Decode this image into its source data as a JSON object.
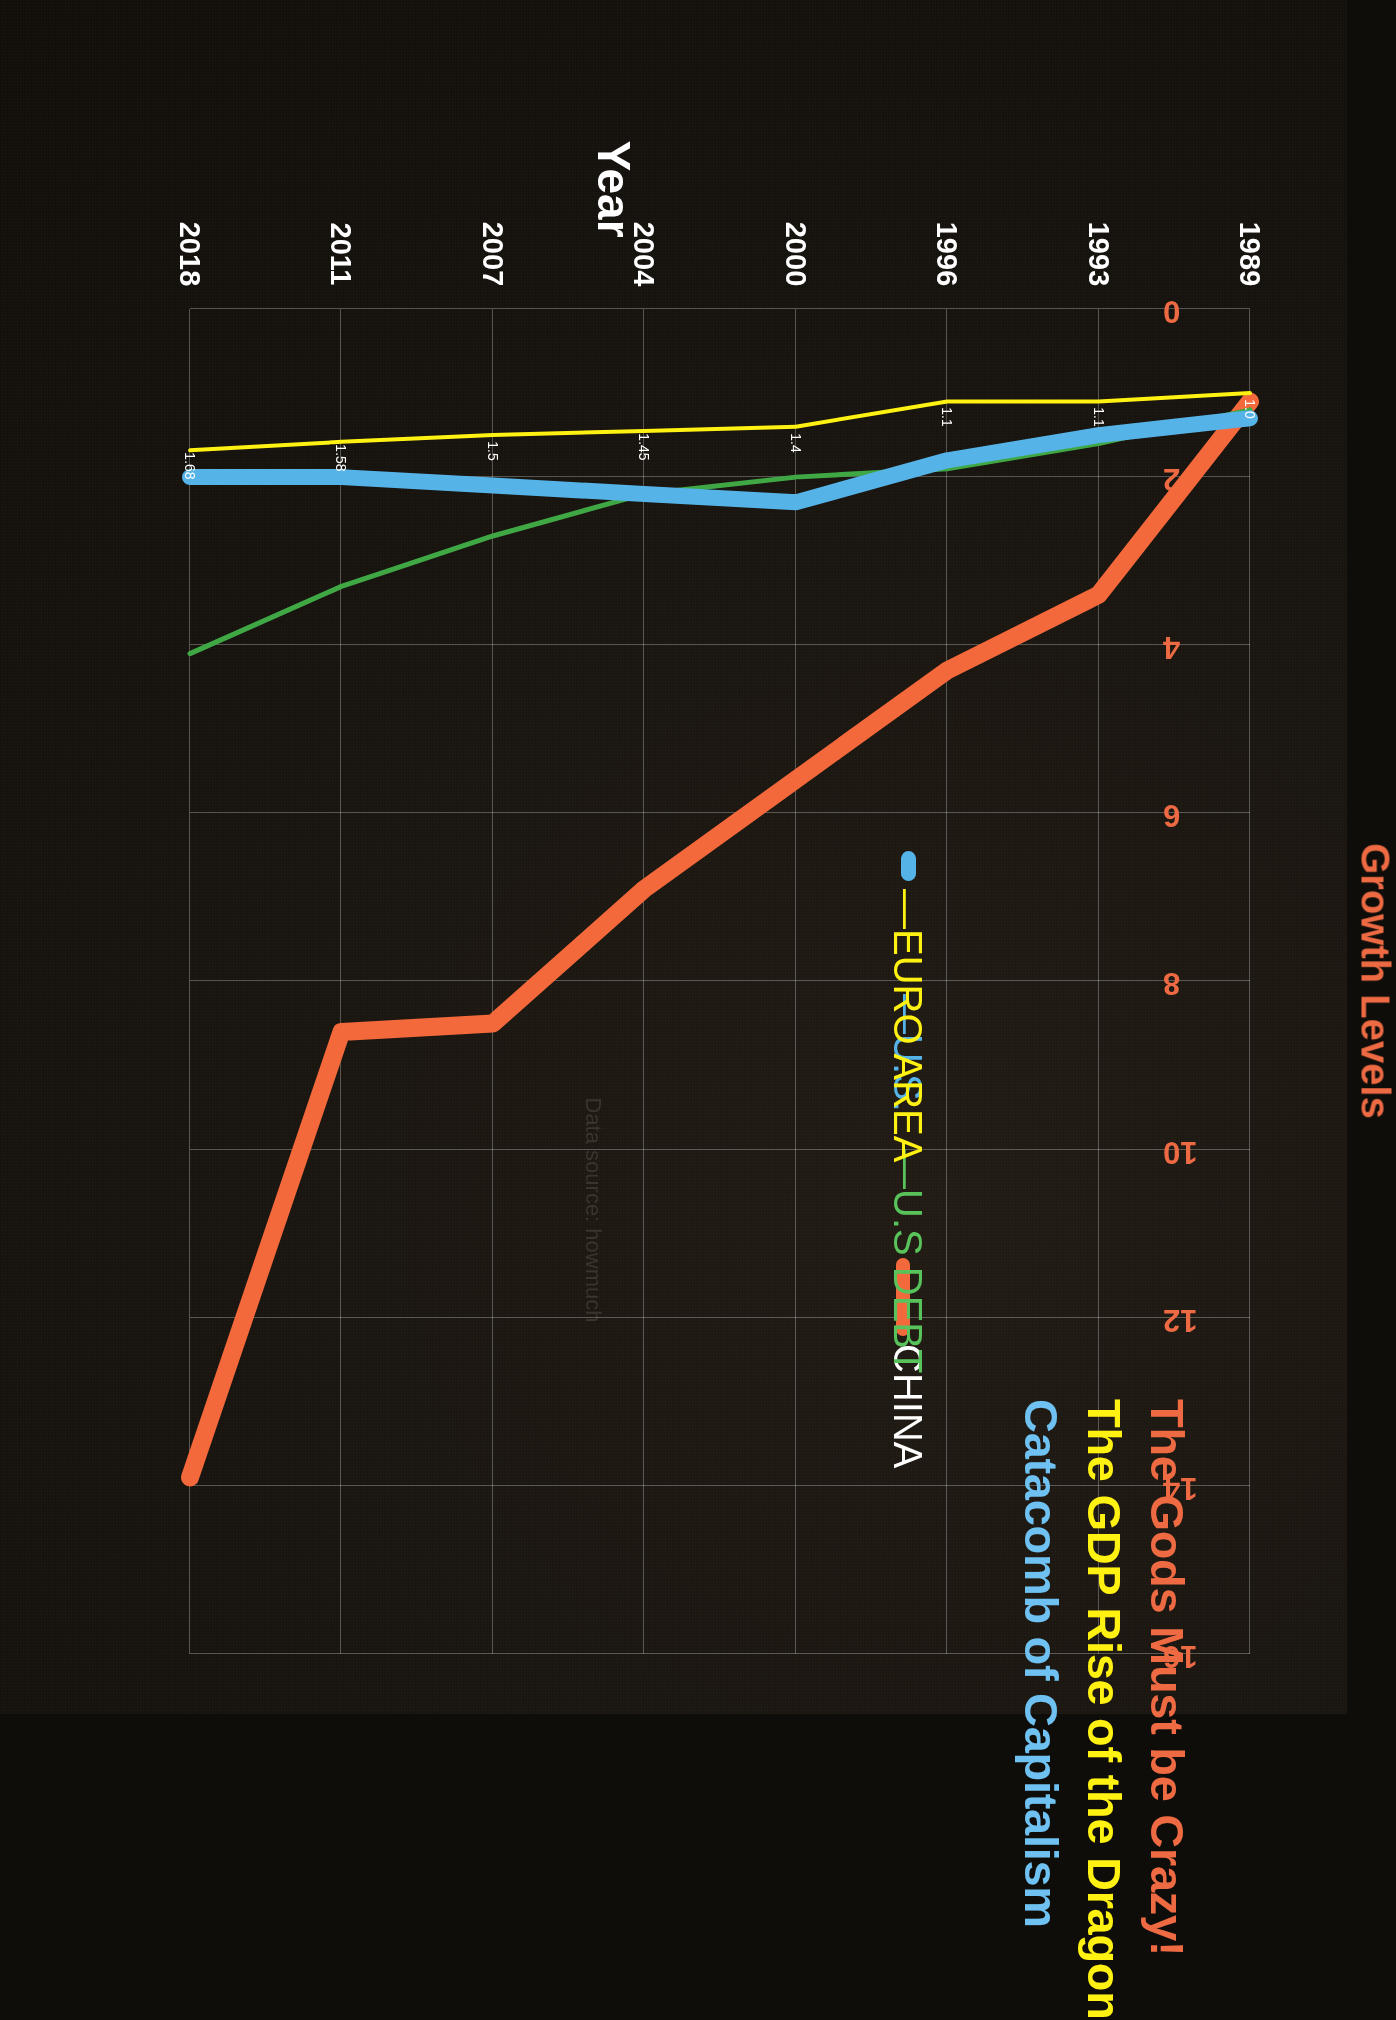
{
  "titles": {
    "line1": "The Gods Must be Crazy!",
    "line2": "The GDP Rise of the Dragon",
    "line3": "Catacomb of Capitalism",
    "color1": "#ED6A43",
    "color2": "#FFF212",
    "color3": "#6EC1F0"
  },
  "axes": {
    "x_title": "Year",
    "y_title": "Growth Levels",
    "x_ticks": [
      "1989",
      "1993",
      "1996",
      "2000",
      "2004",
      "2007",
      "2011",
      "2018"
    ],
    "y_ticks": [
      "0",
      "2",
      "4",
      "6",
      "8",
      "10",
      "12",
      "14",
      "16"
    ],
    "y_title_color": "#ED6A43",
    "x_title_color": "#FFFFFF"
  },
  "legend": [
    {
      "label": "CHINA",
      "color": "#FFFFFF",
      "swatch": "#F4693B"
    },
    {
      "label": "U.S DEBT",
      "color": "#58C35A",
      "swatch": "#58C35A"
    },
    {
      "label": "U.S.",
      "color": "#55B3E8",
      "swatch": "#55B3E8"
    },
    {
      "label": "EURO AREA",
      "color": "#FFF212",
      "swatch": "#FFF212"
    }
  ],
  "watermark": "Data source: howmuch",
  "chart_data": {
    "type": "line",
    "xlabel": "Year",
    "ylabel": "Growth Levels",
    "xlim": [
      1989,
      2018
    ],
    "ylim": [
      0,
      16
    ],
    "grid": true,
    "legend_position": "upper-left",
    "categories": [
      1989,
      1993,
      1996,
      2000,
      2004,
      2007,
      2011,
      2018
    ],
    "series": [
      {
        "name": "CHINA",
        "color": "#F4693B",
        "width": 18,
        "values": [
          1.1,
          3.4,
          4.3,
          5.6,
          6.9,
          8.5,
          8.6,
          13.9
        ]
      },
      {
        "name": "U.S DEBT",
        "color": "#3FA845",
        "width": 5,
        "values": [
          1.2,
          1.6,
          1.9,
          2.0,
          2.2,
          2.7,
          3.3,
          4.1
        ]
      },
      {
        "name": "U.S.",
        "color": "#55B3E8",
        "width": 16,
        "values": [
          1.3,
          1.5,
          1.8,
          2.3,
          2.2,
          2.1,
          2.0,
          2.0
        ]
      },
      {
        "name": "EURO AREA",
        "color": "#FFF212",
        "width": 4,
        "values": [
          1.0,
          1.1,
          1.1,
          1.4,
          1.45,
          1.5,
          1.58,
          1.68
        ],
        "data_labels": [
          "1.0",
          "1.1",
          "1.1",
          "1.4",
          "1.45",
          "1.5",
          "1.58",
          "1.68"
        ]
      }
    ]
  }
}
